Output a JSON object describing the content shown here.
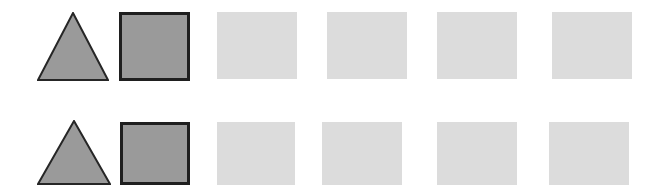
{
  "canvas": {
    "width": 661,
    "height": 196,
    "background_color": "#ffffff"
  },
  "palette": {
    "dark_gray_fill": "#9a9a9a",
    "outline_color": "#262626",
    "light_gray_fill": "#dcdcdc",
    "background": "#ffffff"
  },
  "rows": [
    {
      "name": "row-1",
      "top": 0,
      "shapes": [
        {
          "kind": "triangle",
          "label": "triangle",
          "fill": "#9a9a9a",
          "stroke": "#262626",
          "stroke_width": 2,
          "x": 37,
          "y": 12,
          "width": 72,
          "height": 69
        },
        {
          "kind": "square",
          "label": "square-outlined",
          "fill": "#9a9a9a",
          "stroke": "#1f1f1f",
          "stroke_width": 3,
          "x": 119,
          "y": 12,
          "width": 71,
          "height": 69
        },
        {
          "kind": "square",
          "label": "square-plain",
          "fill": "#dcdcdc",
          "stroke": "none",
          "stroke_width": 0,
          "x": 217,
          "y": 12,
          "width": 80,
          "height": 67
        },
        {
          "kind": "square",
          "label": "square-plain",
          "fill": "#dcdcdc",
          "stroke": "none",
          "stroke_width": 0,
          "x": 327,
          "y": 12,
          "width": 80,
          "height": 67
        },
        {
          "kind": "square",
          "label": "square-plain",
          "fill": "#dcdcdc",
          "stroke": "none",
          "stroke_width": 0,
          "x": 437,
          "y": 12,
          "width": 80,
          "height": 67
        },
        {
          "kind": "square",
          "label": "square-plain",
          "fill": "#dcdcdc",
          "stroke": "none",
          "stroke_width": 0,
          "x": 552,
          "y": 12,
          "width": 80,
          "height": 67
        }
      ]
    },
    {
      "name": "row-2",
      "top": 0,
      "shapes": [
        {
          "kind": "triangle",
          "label": "triangle",
          "fill": "#9a9a9a",
          "stroke": "#262626",
          "stroke_width": 2,
          "x": 37,
          "y": 120,
          "width": 74,
          "height": 65
        },
        {
          "kind": "square",
          "label": "square-outlined",
          "fill": "#9a9a9a",
          "stroke": "#1f1f1f",
          "stroke_width": 3,
          "x": 120,
          "y": 122,
          "width": 70,
          "height": 63
        },
        {
          "kind": "square",
          "label": "square-plain",
          "fill": "#dcdcdc",
          "stroke": "none",
          "stroke_width": 0,
          "x": 217,
          "y": 122,
          "width": 78,
          "height": 63
        },
        {
          "kind": "square",
          "label": "square-plain",
          "fill": "#dcdcdc",
          "stroke": "none",
          "stroke_width": 0,
          "x": 322,
          "y": 122,
          "width": 80,
          "height": 63
        },
        {
          "kind": "square",
          "label": "square-plain",
          "fill": "#dcdcdc",
          "stroke": "none",
          "stroke_width": 0,
          "x": 437,
          "y": 122,
          "width": 80,
          "height": 63
        },
        {
          "kind": "square",
          "label": "square-plain",
          "fill": "#dcdcdc",
          "stroke": "none",
          "stroke_width": 0,
          "x": 549,
          "y": 122,
          "width": 80,
          "height": 63
        }
      ]
    }
  ]
}
